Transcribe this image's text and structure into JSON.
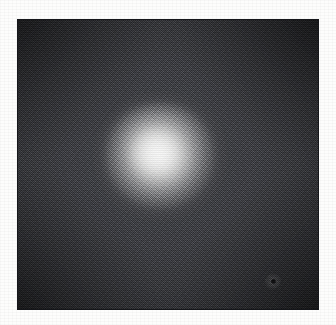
{
  "page": {
    "background_color": "#fdfdfc",
    "width": 336,
    "height": 325,
    "caption": ""
  },
  "plate": {
    "name": "grayscale-image-plate",
    "border_color": "#15161a",
    "border_width_px": 1,
    "left_px": 17,
    "top_px": 19,
    "width_px": 302,
    "height_px": 291,
    "background_color": "#44454a",
    "alt_text": ""
  },
  "image_content": {
    "type": "grayscale-halftone-photograph",
    "subject": "diffuse bright circular object on dark noisy field",
    "field_tone_hex": "#44454a",
    "darkest_corner_hex": "#2a2b2f",
    "brightest_core_hex": "#d8d8d4",
    "texture": "halftone-dither",
    "vignette": "true"
  },
  "chart_data": {
    "type": "heatmap",
    "title": "",
    "xlabel": "",
    "ylabel": "",
    "grid": false,
    "legend": "none",
    "xlim": [
      0,
      302
    ],
    "ylim": [
      0,
      291
    ],
    "features": [
      {
        "name": "central-bright-source",
        "center_x_px": 143,
        "center_y_px": 137,
        "core_radius_px": 30,
        "halo_radius_px": 62,
        "peak_gray_level": 216,
        "peak_gray_hex": "#d8d8d4"
      },
      {
        "name": "background-field",
        "mean_gray_level": 68,
        "mean_gray_hex": "#44454a",
        "noise_amplitude_gray": 22
      },
      {
        "name": "corner-vignette",
        "mean_gray_level": 42,
        "mean_gray_hex": "#2a2b2f"
      },
      {
        "name": "dark-speck-artifact",
        "center_x_px": 255,
        "center_y_px": 261,
        "diameter_px": 5,
        "gray_level": 12,
        "gray_hex": "#0c0c0e"
      }
    ],
    "radial_profile": {
      "radius_px": [
        0,
        8,
        16,
        24,
        32,
        40,
        48,
        56,
        64,
        80,
        100,
        130
      ],
      "gray_level": [
        216,
        209,
        194,
        172,
        148,
        124,
        104,
        90,
        81,
        73,
        68,
        58
      ]
    }
  }
}
